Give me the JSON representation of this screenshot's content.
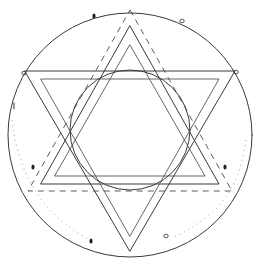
{
  "figure": {
    "title": "",
    "colors": {
      "background": "#ffffff",
      "ink": "#3a3a3a",
      "faint": "#8a8a8a"
    },
    "outer_circle": {
      "cx": 130,
      "cy": 135,
      "r": 122
    },
    "inner_circle": {
      "cx": 130,
      "cy": 130,
      "r": 60
    },
    "up_triangle_outer": [
      [
        130,
        26
      ],
      [
        219,
        184
      ],
      [
        41,
        184
      ]
    ],
    "up_triangle_inner": [
      [
        130,
        45
      ],
      [
        205,
        176
      ],
      [
        55,
        176
      ]
    ],
    "down_triangle_outer": [
      [
        25,
        71
      ],
      [
        235,
        71
      ],
      [
        130,
        251
      ]
    ],
    "down_triangle_inner": [
      [
        41,
        79
      ],
      [
        219,
        79
      ],
      [
        130,
        236
      ]
    ],
    "dashed_triangle": [
      [
        130,
        10
      ],
      [
        232,
        191
      ],
      [
        28,
        191
      ]
    ],
    "marks": [
      {
        "type": "blob",
        "x": 94,
        "y": 16
      },
      {
        "type": "ring",
        "x": 182,
        "y": 21
      },
      {
        "type": "ring",
        "x": 24,
        "y": 73
      },
      {
        "type": "ring",
        "x": 236,
        "y": 72
      },
      {
        "type": "tick",
        "x": 14,
        "y": 106
      },
      {
        "type": "blob",
        "x": 33,
        "y": 167
      },
      {
        "type": "blob",
        "x": 225,
        "y": 167
      },
      {
        "type": "blob",
        "x": 91,
        "y": 241
      },
      {
        "type": "ring",
        "x": 166,
        "y": 236
      }
    ]
  }
}
